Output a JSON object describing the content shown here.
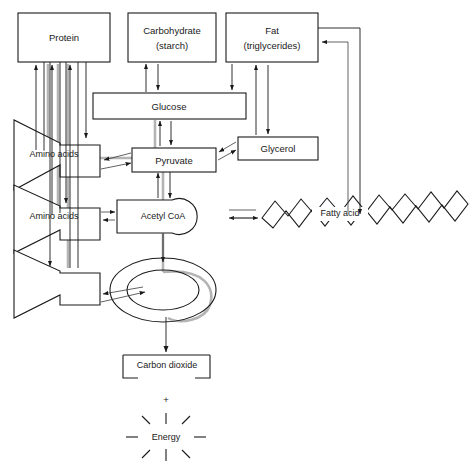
{
  "diagram": {
    "canvas": {
      "width": 476,
      "height": 468,
      "background": "#ffffff"
    },
    "line_color": "#1a1a1a",
    "highlight_color": "#b4b4b4",
    "nodes": {
      "protein": {
        "label": "Protein",
        "shape": "rectangle"
      },
      "carbohydrate": {
        "label_line1": "Carbohydrate",
        "label_line2": "(starch)",
        "shape": "rectangle"
      },
      "fat": {
        "label_line1": "Fat",
        "label_line2": "(triglycerides)",
        "shape": "rectangle"
      },
      "glucose": {
        "label": "Glucose",
        "shape": "rectangle"
      },
      "glycerol": {
        "label": "Glycerol",
        "shape": "rectangle"
      },
      "pyruvate": {
        "label": "Pyruvate",
        "shape": "rectangle"
      },
      "amino_acids_1": {
        "label": "Amino acids",
        "shape": "funnel"
      },
      "amino_acids_2": {
        "label": "Amino acids",
        "shape": "funnel"
      },
      "amino_acids_3": {
        "label": "",
        "shape": "funnel"
      },
      "acetyl_coa": {
        "label": "Acetyl  CoA",
        "shape": "rectangle-with-bulge"
      },
      "fatty_acid": {
        "label": "Fatty acid",
        "shape": "zigzag-chain"
      },
      "krebs_cycle": {
        "label": "",
        "shape": "double-ellipse"
      },
      "carbon_dioxide": {
        "label": "Carbon dioxide",
        "shape": "broken-rectangle"
      },
      "plus_sign": {
        "label": "+",
        "shape": "text"
      },
      "energy": {
        "label": "Energy",
        "shape": "sunburst",
        "rays": 8
      }
    }
  }
}
